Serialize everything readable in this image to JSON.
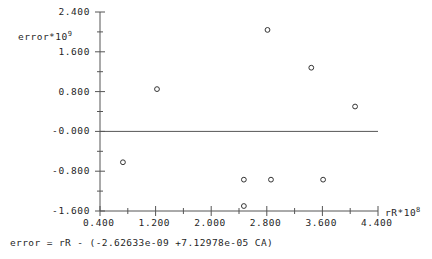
{
  "chart_data": {
    "type": "scatter",
    "title": "",
    "xlabel": "rR*10^8",
    "ylabel": "error*10^9",
    "xlabel_base": "rR*10",
    "xlabel_exp": "8",
    "ylabel_base": "error*10",
    "ylabel_exp": "9",
    "xlim": [
      0.4,
      4.4
    ],
    "ylim": [
      -1.6,
      2.4
    ],
    "xticks": [
      0.4,
      1.2,
      2.0,
      2.8,
      3.6,
      4.4
    ],
    "yticks": [
      2.4,
      1.6,
      0.8,
      -0.0,
      -0.8,
      -1.6
    ],
    "xtick_labels": [
      "0.400",
      "1.200",
      "2.000",
      "2.800",
      "3.600",
      "4.400"
    ],
    "ytick_labels": [
      "2.400",
      "1.600",
      "0.800",
      "-0.000",
      "-0.800",
      "-1.600"
    ],
    "minor_ticks": true,
    "grid": false,
    "legend": null,
    "zero_line": 0.0,
    "marker": "open-circle",
    "x": [
      0.73,
      1.22,
      2.81,
      3.44,
      4.07,
      2.47,
      2.86,
      3.61,
      2.47
    ],
    "y": [
      -0.62,
      0.85,
      2.04,
      1.28,
      0.5,
      -0.97,
      -0.97,
      -0.97,
      -1.5
    ],
    "points": [
      {
        "x": 0.73,
        "y": -0.62
      },
      {
        "x": 1.22,
        "y": 0.85
      },
      {
        "x": 2.81,
        "y": 2.04
      },
      {
        "x": 3.44,
        "y": 1.28
      },
      {
        "x": 4.07,
        "y": 0.5
      },
      {
        "x": 2.47,
        "y": -0.97
      },
      {
        "x": 2.86,
        "y": -0.97
      },
      {
        "x": 3.61,
        "y": -0.97
      },
      {
        "x": 2.47,
        "y": -1.5
      }
    ]
  },
  "caption": {
    "equation": "error = rR - (-2.62633e-09 +7.12978e-05 CA)"
  },
  "style": {
    "axis_color": "#555555",
    "marker_color": "#333333",
    "text_color": "#1f1f1f",
    "background": "#ffffff"
  }
}
